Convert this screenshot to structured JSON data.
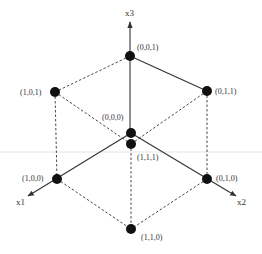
{
  "diagram": {
    "axes": [
      {
        "id": "x1",
        "label": "x1"
      },
      {
        "id": "x2",
        "label": "x2"
      },
      {
        "id": "x3",
        "label": "x3"
      }
    ],
    "vertices": [
      {
        "id": "v001",
        "label": "(0,0,1)"
      },
      {
        "id": "v101",
        "label": "(1,0,1)"
      },
      {
        "id": "v011",
        "label": "(0,1,1)"
      },
      {
        "id": "v000",
        "label": "(0,0,0)"
      },
      {
        "id": "v111",
        "label": "(1,1,1)"
      },
      {
        "id": "v100",
        "label": "(1,0,0)"
      },
      {
        "id": "v010",
        "label": "(0,1,0)"
      },
      {
        "id": "v110",
        "label": "(1,1,0)"
      }
    ],
    "edges_solid": [
      [
        "v000",
        "v001"
      ],
      [
        "v000",
        "v100"
      ],
      [
        "v000",
        "v010"
      ],
      [
        "v001",
        "v011"
      ]
    ],
    "edges_dashed": [
      [
        "v001",
        "v101"
      ],
      [
        "v101",
        "v111"
      ],
      [
        "v011",
        "v111"
      ],
      [
        "v101",
        "v100"
      ],
      [
        "v011",
        "v010"
      ],
      [
        "v111",
        "v110"
      ],
      [
        "v100",
        "v110"
      ],
      [
        "v010",
        "v110"
      ]
    ],
    "colors": {
      "ink": "#333333",
      "node": "#111111",
      "background": "#ffffff"
    }
  }
}
